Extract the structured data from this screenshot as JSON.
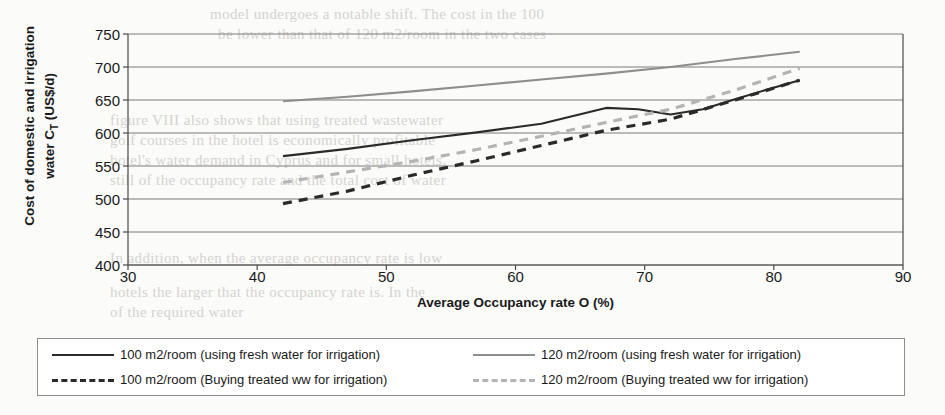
{
  "chart_data": {
    "type": "line",
    "title": "",
    "xlabel": "Average Occupancy rate O (%)",
    "ylabel": "Cost of domestic and irrigation water C_T (US$/d)",
    "ylabel_line1": "Cost of domestic and irrigation",
    "ylabel_line2_pre": "water C",
    "ylabel_line2_sub": "T",
    "ylabel_line2_post": " (US$/d)",
    "xlim": [
      30,
      90
    ],
    "ylim": [
      400,
      750
    ],
    "xticks": [
      30,
      40,
      50,
      60,
      70,
      80,
      90
    ],
    "yticks": [
      400,
      450,
      500,
      550,
      600,
      650,
      700,
      750
    ],
    "grid": "horizontal",
    "legend_position": "bottom",
    "series": [
      {
        "name": "100 m2/room (using fresh water for irrigation)",
        "style": "solid",
        "color": "#2a2a2a",
        "x": [
          42.0,
          47.0,
          52.0,
          57.0,
          62.0,
          67.0,
          69.5,
          72.0,
          74.5,
          77.0,
          79.5,
          82.0
        ],
        "y": [
          565,
          576,
          589,
          601,
          614,
          638,
          636,
          628,
          636,
          651,
          666,
          680
        ]
      },
      {
        "name": "120 m2/room (using fresh water for irrigation)",
        "style": "solid",
        "color": "#8e8e8e",
        "x": [
          42.0,
          47.0,
          52.0,
          57.0,
          62.0,
          67.0,
          72.0,
          77.0,
          82.0
        ],
        "y": [
          648,
          655,
          663,
          672,
          681,
          690,
          700,
          712,
          723
        ]
      },
      {
        "name": "100 m2/room (Buying treated ww for irrigation)",
        "style": "dashed",
        "color": "#2a2a2a",
        "x": [
          42.0,
          47.0,
          52.0,
          57.0,
          62.0,
          67.0,
          72.0,
          77.0,
          82.0
        ],
        "y": [
          493,
          512,
          536,
          558,
          581,
          604,
          621,
          650,
          680
        ]
      },
      {
        "name": "120 m2/room (Buying treated ww for irrigation)",
        "style": "dashed",
        "color": "#b4b4b4",
        "x": [
          42.0,
          47.0,
          52.0,
          57.0,
          62.0,
          67.0,
          72.0,
          77.0,
          82.0
        ],
        "y": [
          525,
          541,
          557,
          575,
          595,
          616,
          636,
          665,
          698
        ]
      }
    ]
  },
  "legend": {
    "items": [
      {
        "label": "100 m2/room (using fresh water for irrigation)",
        "swatch": "solid-dark"
      },
      {
        "label": "120 m2/room (using fresh water for irrigation)",
        "swatch": "solid-gray"
      },
      {
        "label": "100 m2/room (Buying treated ww for irrigation)",
        "swatch": "dash-dark"
      },
      {
        "label": "120 m2/room (Buying treated ww for irrigation)",
        "swatch": "dash-gray"
      }
    ]
  },
  "background_text": {
    "lines": [
      {
        "text": "model undergoes a notable shift. The cost in the 100",
        "x": 210,
        "y": 6
      },
      {
        "text": "be lower than that of 120 m2/room in the two cases",
        "x": 218,
        "y": 26
      },
      {
        "text": "figure VIII also shows that using treated wastewater",
        "x": 110,
        "y": 112
      },
      {
        "text": "golf courses in the hotel is economically profitable",
        "x": 110,
        "y": 132
      },
      {
        "text": "hotel's water demand in Cyprus and for small hotels,",
        "x": 110,
        "y": 152
      },
      {
        "text": "still of the occupancy rate and the total cost of water",
        "x": 110,
        "y": 172
      },
      {
        "text": "In addition, when the average occupancy rate is low",
        "x": 110,
        "y": 250
      },
      {
        "text": "hotels the larger that the occupancy rate is. In the",
        "x": 110,
        "y": 284
      },
      {
        "text": "of the required water",
        "x": 110,
        "y": 304
      }
    ]
  }
}
